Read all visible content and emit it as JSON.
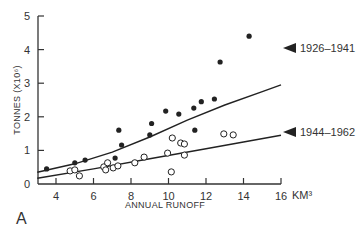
{
  "chart_data": {
    "type": "scatter",
    "title": "",
    "panel_label": "A",
    "xlabel": "ANNUAL RUNOFF",
    "x_unit": "KM³",
    "ylabel": "TONNES (X10⁶)",
    "xlim": [
      3,
      16
    ],
    "ylim": [
      0,
      5
    ],
    "x_ticks": [
      4,
      6,
      8,
      10,
      12,
      14,
      16
    ],
    "y_ticks": [
      0,
      1,
      2,
      3,
      4,
      5
    ],
    "grid": false,
    "legend_position": "right, annotated at curve ends",
    "series": [
      {
        "name": "1926–1941",
        "marker": "filled-circle",
        "points": [
          [
            3.5,
            0.45
          ],
          [
            5.0,
            0.63
          ],
          [
            5.55,
            0.71
          ],
          [
            7.15,
            0.77
          ],
          [
            7.5,
            1.16
          ],
          [
            7.35,
            1.6
          ],
          [
            9.0,
            1.46
          ],
          [
            9.1,
            1.8
          ],
          [
            9.85,
            2.17
          ],
          [
            10.55,
            2.08
          ],
          [
            11.35,
            2.26
          ],
          [
            11.4,
            1.6
          ],
          [
            11.75,
            2.45
          ],
          [
            12.45,
            2.53
          ],
          [
            12.75,
            3.63
          ],
          [
            14.3,
            4.4
          ]
        ],
        "fit_curve": [
          [
            3.0,
            0.35
          ],
          [
            5.0,
            0.6
          ],
          [
            7.0,
            0.95
          ],
          [
            9.0,
            1.4
          ],
          [
            11.0,
            1.9
          ],
          [
            13.0,
            2.35
          ],
          [
            15.0,
            2.75
          ],
          [
            16.0,
            2.95
          ]
        ]
      },
      {
        "name": "1944–1962",
        "marker": "open-circle",
        "points": [
          [
            4.75,
            0.39
          ],
          [
            5.0,
            0.42
          ],
          [
            5.25,
            0.24
          ],
          [
            6.55,
            0.51
          ],
          [
            6.75,
            0.63
          ],
          [
            6.65,
            0.42
          ],
          [
            7.05,
            0.48
          ],
          [
            7.3,
            0.54
          ],
          [
            8.2,
            0.63
          ],
          [
            8.7,
            0.8
          ],
          [
            9.95,
            0.92
          ],
          [
            10.2,
            1.37
          ],
          [
            10.65,
            1.22
          ],
          [
            10.85,
            1.19
          ],
          [
            10.85,
            0.86
          ],
          [
            10.15,
            0.36
          ],
          [
            12.95,
            1.49
          ],
          [
            13.45,
            1.46
          ]
        ],
        "fit_curve": [
          [
            3.0,
            0.17
          ],
          [
            6.0,
            0.45
          ],
          [
            9.0,
            0.75
          ],
          [
            12.0,
            1.05
          ],
          [
            14.0,
            1.25
          ],
          [
            16.0,
            1.45
          ]
        ]
      }
    ]
  },
  "labels": {
    "panel": "A",
    "xlabel": "ANNUAL RUNOFF",
    "x_unit": "KM³",
    "ylabel": "TONNES (X10⁶)",
    "legend_1": "1926–1941",
    "legend_2": "1944–1962"
  }
}
